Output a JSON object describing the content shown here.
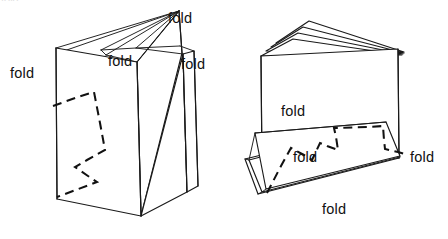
{
  "figure": {
    "background_color": "#ffffff",
    "ink_color": "#111111",
    "width": 448,
    "height": 239,
    "clipped_header_fragment": "fold"
  },
  "labels": [
    {
      "id": "left-fold-top",
      "text": "fold",
      "x": 168,
      "y": 11,
      "figure": "left"
    },
    {
      "id": "left-fold-middle",
      "text": "fold",
      "x": 108,
      "y": 54,
      "figure": "left"
    },
    {
      "id": "left-fold-left",
      "text": "fold",
      "x": 10,
      "y": 66,
      "figure": "left"
    },
    {
      "id": "left-fold-right",
      "text": "fold",
      "x": 181,
      "y": 57,
      "figure": "left"
    },
    {
      "id": "right-fold-upper",
      "text": "fold",
      "x": 281,
      "y": 104,
      "figure": "right"
    },
    {
      "id": "right-fold-inner",
      "text": "fold",
      "x": 293,
      "y": 150,
      "figure": "right"
    },
    {
      "id": "right-fold-edge",
      "text": "fold",
      "x": 410,
      "y": 150,
      "figure": "right"
    },
    {
      "id": "right-fold-lower",
      "text": "fold",
      "x": 322,
      "y": 202,
      "figure": "right"
    }
  ],
  "left_figure": {
    "name": "standing-accordion-book",
    "front_panel": "M 56,48 L 137,62 L 141,216 L 57,199 Z",
    "fan_edges": [
      "M 56,48 L 179,11",
      "M 62,50 L 179,11",
      "M 137,62 L 179,11",
      "M 137,57 L 179,11",
      "M 105,51 L 179,11",
      "M 100,49 L 179,11"
    ],
    "rear_panels": [
      "M 137,62 L 179,11 L 182,53 L 141,216 L 137,62",
      "M 141,216 L 183,54 L 187,192",
      "M 183,54 L 194,51 L 198,186 L 187,192",
      "M 137,57 L 180,46 L 183,54",
      "M 105,51 L 179,11",
      "M 136,48 L 179,11 L 183,54 L 137,62"
    ],
    "crease_lines": [
      "M 56,48 L 57,199",
      "M 137,62 L 141,216",
      "M 179,11 L 182,53",
      "M 183,54 L 187,192",
      "M 194,51 L 198,186"
    ],
    "zigzag": "M 53,106 L 78,97 L 94,92 L 100,123 L 105,150 L 87,160 L 75,167 L 88,176 L 97,182 L 57,197"
  },
  "right_figure": {
    "name": "laid-open-accordion-book",
    "front_panel": "M 261,56 L 398,49 L 399,158 L 262,170 Z",
    "fan_edges": [
      "M 261,56 L 298,27 L 404,52",
      "M 266,51 L 300,29 L 404,52",
      "M 271,47 L 305,24 L 404,52",
      "M 276,43 L 309,21 L 404,52",
      "M 404,52 L 399,49"
    ],
    "lower_flap": "M 255,133 L 386,122 L 400,156 L 266,189 Z",
    "lower_flap_back": "M 249,160 L 381,126 L 387,125 L 399,158 L 262,192 Z",
    "lower_flap_edges": [
      "M 249,160 L 255,133",
      "M 262,192 L 266,189",
      "M 245,159 L 251,132",
      "M 258,194 L 262,192"
    ],
    "crease_lines": [
      "M 262,170 L 399,158",
      "M 261,56 L 262,170",
      "M 398,49 L 399,158"
    ],
    "zigzag": "M 267,193 L 281,166 L 291,148 L 304,155 L 312,160 L 320,143 L 327,146 L 338,150 L 336,137 L 334,128 L 368,127 L 383,126 L 384,140 L 385,149 L 398,152 L 408,155"
  }
}
